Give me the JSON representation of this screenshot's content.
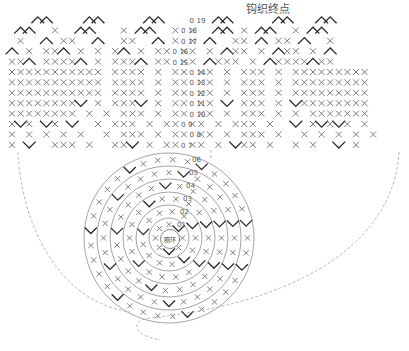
{
  "title_label": "钩织终点",
  "center_label": "圈环",
  "row_numbers": [
    "19",
    "18",
    "17",
    "16",
    "15",
    "14",
    "13",
    "12",
    "11",
    "10",
    "9",
    "8",
    "7"
  ],
  "round_numbers": [
    "1",
    "2",
    "3",
    "4",
    "5",
    "6"
  ],
  "symbols": {
    "single_crochet": "X",
    "slip_stitch": "0",
    "increase": "V",
    "decrease": "^"
  },
  "colors": {
    "stitch": "#6f6f6f",
    "accent": "#2a2a2a",
    "ring": "#9a9a9a",
    "dash": "#a8a8a8"
  },
  "chart_grid": {
    "cell_w": 8.6,
    "cell_h": 10.4,
    "origin_x": 12,
    "origin_y": 20,
    "rows": [
      "   ^^    ^^     ^^   0  ^^     ^^   ^^  ",
      " ^^  X  ^^   X ^^  X0X  ^^ X ^^  X ^^   ",
      " X  ^ XX  ^  XX  ^ X0X ^  XX ^ XX ^  X  ",
      "^ X XX^ X X X^ X XX0XX X ^XX X ^XX X ^  ",
      "XX^ XXXX^ X XXX^ XX0XX ^XXX X ^XXXX^XX  ",
      "XXXXXXXXXXX XXXX X XX0XX X XXX X XXXXXXXXX",
      "XXXXXXXXXXX XXXX X XX0XX X XXX X XXXXXXXXX",
      "XXXXXXXXXXX XXXX X XX0XX X XXX X XXXXXXXXX",
      "XXXXXXXXV X XXXV X XX0XX V XXX X VXXXXXXXX",
      "XXXXXXXX X X XXX X XX0XX X XXX X X XXXXXXX",
      "XVX VX V  X XXX X XX0XX X XXX X  V XVXVX X",
      "X X X X X  X XXX X XX0XX X XXX X  X X X X X",
      "X V  XXX X  XXV X XX0XX X VXX X  X X  V X "
    ]
  }
}
